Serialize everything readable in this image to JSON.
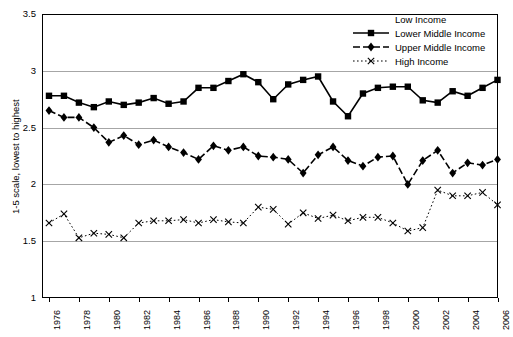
{
  "chart_data": {
    "type": "line",
    "title": "",
    "xlabel": "",
    "ylabel": "1-5 scale, lowest to highest",
    "ylim": [
      1,
      3.5
    ],
    "ytick_values": [
      1,
      1.5,
      2,
      2.5,
      3,
      3.5
    ],
    "ytick_labels": [
      "1",
      "1.5",
      "2",
      "2.5",
      "3",
      "3.5"
    ],
    "grid": "horizontal",
    "legend_position": "top-right",
    "legend_title": "Low Income",
    "x": [
      1976,
      1977,
      1978,
      1979,
      1980,
      1981,
      1982,
      1983,
      1984,
      1985,
      1986,
      1987,
      1988,
      1989,
      1990,
      1991,
      1992,
      1993,
      1994,
      1995,
      1996,
      1997,
      1998,
      1999,
      2000,
      2001,
      2002,
      2003,
      2004,
      2005,
      2006
    ],
    "xtick_labels": [
      "1976",
      "1978",
      "1980",
      "1982",
      "1984",
      "1986",
      "1988",
      "1990",
      "1992",
      "1994",
      "1996",
      "1998",
      "2000",
      "2002",
      "2004",
      "2006"
    ],
    "xtick_values": [
      1976,
      1978,
      1980,
      1982,
      1984,
      1986,
      1988,
      1990,
      1992,
      1994,
      1996,
      1998,
      2000,
      2002,
      2004,
      2006
    ],
    "series": [
      {
        "name": "Lower Middle Income",
        "marker": "square",
        "linestyle": "solid",
        "color": "#000000",
        "values": [
          2.78,
          2.78,
          2.72,
          2.68,
          2.73,
          2.7,
          2.72,
          2.76,
          2.71,
          2.73,
          2.85,
          2.85,
          2.91,
          2.97,
          2.9,
          2.75,
          2.88,
          2.92,
          2.95,
          2.73,
          2.6,
          2.8,
          2.85,
          2.86,
          2.86,
          2.74,
          2.72,
          2.82,
          2.78,
          2.85,
          2.92
        ]
      },
      {
        "name": "Upper Middle Income",
        "marker": "diamond",
        "linestyle": "dashed",
        "color": "#000000",
        "values": [
          2.65,
          2.59,
          2.59,
          2.5,
          2.37,
          2.43,
          2.35,
          2.39,
          2.33,
          2.28,
          2.22,
          2.34,
          2.3,
          2.33,
          2.25,
          2.24,
          2.22,
          2.1,
          2.26,
          2.33,
          2.21,
          2.16,
          2.24,
          2.25,
          2.0,
          2.21,
          2.3,
          2.1,
          2.19,
          2.17,
          2.22
        ]
      },
      {
        "name": "High Income",
        "marker": "x",
        "linestyle": "dotted",
        "color": "#000000",
        "values": [
          1.66,
          1.74,
          1.53,
          1.57,
          1.56,
          1.53,
          1.66,
          1.68,
          1.68,
          1.69,
          1.66,
          1.69,
          1.67,
          1.66,
          1.8,
          1.78,
          1.65,
          1.75,
          1.7,
          1.73,
          1.68,
          1.71,
          1.71,
          1.66,
          1.59,
          1.62,
          1.95,
          1.9,
          1.9,
          1.93,
          1.82
        ]
      }
    ],
    "legend_entries": [
      {
        "label": "Low Income",
        "marker": "none",
        "linestyle": "none"
      },
      {
        "label": "Lower Middle Income",
        "marker": "square",
        "linestyle": "solid"
      },
      {
        "label": "Upper Middle Income",
        "marker": "diamond",
        "linestyle": "dashed"
      },
      {
        "label": "High Income",
        "marker": "x",
        "linestyle": "dotted"
      }
    ]
  },
  "geometry": {
    "plot_left": 42,
    "plot_top": 14,
    "plot_right": 498,
    "plot_bottom": 298,
    "first_point_x": 49,
    "point_spacing": 14.95,
    "legend_left": 352,
    "legend_top": 12
  }
}
